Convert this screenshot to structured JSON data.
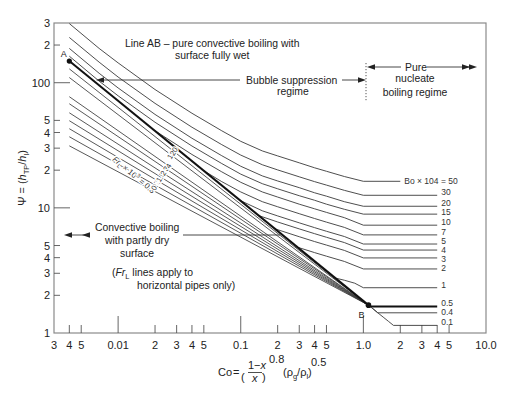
{
  "chart_data": {
    "type": "line",
    "title": "",
    "x_scale": "log",
    "y_scale": "log",
    "xlim": [
      0.003,
      10
    ],
    "ylim": [
      1,
      300
    ],
    "grid": false,
    "legend": "none",
    "xlabel": {
      "lhs": "Co",
      "eq": "=",
      "open": "(",
      "num_prefix": "1−",
      "num_var": "x",
      "den_var": "x",
      "close": ")",
      "exp1": "0.8",
      "rho_open": "(ρ",
      "rho_g_sub": "g",
      "slash_rho": "/ρ",
      "rho_l_sub": "l",
      "rho_close": ")",
      "exp2": "0.5"
    },
    "ylabel": {
      "symbol": "Ψ",
      "eq": " = (",
      "h1": "h",
      "h1_sub": "TP",
      "slash": "/",
      "h2": "h",
      "h2_sub": "l",
      "close": ")"
    },
    "x_ticks": [
      {
        "value": 0.003,
        "label": "3"
      },
      {
        "value": 0.004,
        "label": "4"
      },
      {
        "value": 0.005,
        "label": "5"
      },
      {
        "value": 0.01,
        "label": "0.01"
      },
      {
        "value": 0.02,
        "label": "2"
      },
      {
        "value": 0.03,
        "label": "3"
      },
      {
        "value": 0.04,
        "label": "4"
      },
      {
        "value": 0.05,
        "label": "5"
      },
      {
        "value": 0.1,
        "label": "0.1"
      },
      {
        "value": 0.2,
        "label": "2"
      },
      {
        "value": 0.3,
        "label": "3"
      },
      {
        "value": 0.4,
        "label": "4"
      },
      {
        "value": 0.5,
        "label": "5"
      },
      {
        "value": 1,
        "label": "1.0"
      },
      {
        "value": 2,
        "label": "2"
      },
      {
        "value": 3,
        "label": "3"
      },
      {
        "value": 4,
        "label": "4"
      },
      {
        "value": 5,
        "label": "5"
      },
      {
        "value": 10,
        "label": "10.0"
      }
    ],
    "y_ticks": [
      {
        "value": 300,
        "label": "3"
      },
      {
        "value": 200,
        "label": "2"
      },
      {
        "value": 100,
        "label": "100"
      },
      {
        "value": 50,
        "label": "5"
      },
      {
        "value": 40,
        "label": "4"
      },
      {
        "value": 30,
        "label": "3"
      },
      {
        "value": 20,
        "label": "2"
      },
      {
        "value": 10,
        "label": "10"
      },
      {
        "value": 5,
        "label": "5"
      },
      {
        "value": 4,
        "label": "4"
      },
      {
        "value": 3,
        "label": "3"
      },
      {
        "value": 2,
        "label": "2"
      },
      {
        "value": 1,
        "label": "1"
      }
    ],
    "line_AB": {
      "label": "Line AB",
      "points": [
        [
          0.004,
          149
        ],
        [
          1.1,
          1.67
        ]
      ],
      "A": {
        "label": "A",
        "co": 0.004,
        "psi": 149
      },
      "B": {
        "label": "B",
        "co": 1.1,
        "psi": 1.67
      }
    },
    "bo_series": [
      {
        "label": "Bo × 104 = 50",
        "bo_x1e4": 50,
        "points": [
          [
            0.004,
            297
          ],
          [
            0.007,
            188
          ],
          [
            0.01,
            144
          ],
          [
            0.02,
            88.2
          ],
          [
            0.04,
            57.0
          ],
          [
            0.07,
            41.3
          ],
          [
            0.1,
            34.0
          ],
          [
            0.15,
            28.5
          ],
          [
            0.2,
            26.0
          ],
          [
            0.3,
            22.9
          ],
          [
            0.4,
            20.9
          ],
          [
            0.5,
            19.6
          ],
          [
            0.7,
            17.8
          ],
          [
            1.0,
            16.3
          ],
          [
            2.0,
            16.3
          ]
        ]
      },
      {
        "label": "30",
        "bo_x1e4": 30,
        "points": [
          [
            0.004,
            230
          ],
          [
            0.007,
            146
          ],
          [
            0.01,
            111
          ],
          [
            0.02,
            68.4
          ],
          [
            0.04,
            44.1
          ],
          [
            0.07,
            32.0
          ],
          [
            0.1,
            26.4
          ],
          [
            0.15,
            22.1
          ],
          [
            0.2,
            20.1
          ],
          [
            0.3,
            17.7
          ],
          [
            0.4,
            16.2
          ],
          [
            0.5,
            15.2
          ],
          [
            0.7,
            13.8
          ],
          [
            1.0,
            12.6
          ],
          [
            4.0,
            12.6
          ]
        ]
      },
      {
        "label": "20",
        "bo_x1e4": 20,
        "points": [
          [
            0.004,
            188
          ],
          [
            0.007,
            119
          ],
          [
            0.01,
            90.8
          ],
          [
            0.02,
            55.8
          ],
          [
            0.04,
            36.0
          ],
          [
            0.07,
            26.1
          ],
          [
            0.1,
            21.5
          ],
          [
            0.15,
            18.0
          ],
          [
            0.2,
            16.4
          ],
          [
            0.3,
            14.5
          ],
          [
            0.4,
            13.2
          ],
          [
            0.5,
            12.4
          ],
          [
            0.7,
            11.2
          ],
          [
            1.0,
            10.3
          ],
          [
            4.0,
            10.3
          ]
        ]
      },
      {
        "label": "15",
        "bo_x1e4": 15,
        "points": [
          [
            0.004,
            163
          ],
          [
            0.007,
            103
          ],
          [
            0.01,
            78.6
          ],
          [
            0.02,
            48.3
          ],
          [
            0.04,
            31.2
          ],
          [
            0.07,
            22.6
          ],
          [
            0.1,
            18.6
          ],
          [
            0.15,
            15.6
          ],
          [
            0.2,
            14.2
          ],
          [
            0.3,
            12.5
          ],
          [
            0.4,
            11.5
          ],
          [
            0.5,
            10.7
          ],
          [
            0.7,
            9.74
          ],
          [
            1.0,
            8.91
          ],
          [
            4.0,
            8.91
          ]
        ]
      },
      {
        "label": "10",
        "bo_x1e4": 10,
        "points": [
          [
            0.02,
            41.3
          ],
          [
            0.04,
            26.7
          ],
          [
            0.07,
            19.4
          ],
          [
            0.1,
            16.0
          ],
          [
            0.15,
            13.4
          ],
          [
            0.2,
            12.2
          ],
          [
            0.3,
            10.7
          ],
          [
            0.4,
            9.83
          ],
          [
            0.5,
            9.2
          ],
          [
            0.7,
            8.35
          ],
          [
            1.0,
            7.27
          ],
          [
            4.0,
            7.27
          ]
        ]
      },
      {
        "label": "7",
        "bo_x1e4": 7,
        "points": [
          [
            0.05,
            19.8
          ],
          [
            0.07,
            16.2
          ],
          [
            0.1,
            13.4
          ],
          [
            0.15,
            11.2
          ],
          [
            0.2,
            10.2
          ],
          [
            0.3,
            8.98
          ],
          [
            0.4,
            8.22
          ],
          [
            0.5,
            7.69
          ],
          [
            0.7,
            6.98
          ],
          [
            1.0,
            6.08
          ],
          [
            4.0,
            6.08
          ]
        ]
      },
      {
        "label": "5",
        "bo_x1e4": 5,
        "points": [
          [
            0.1,
            11.4
          ],
          [
            0.15,
            9.47
          ],
          [
            0.2,
            8.62
          ],
          [
            0.3,
            7.59
          ],
          [
            0.4,
            6.95
          ],
          [
            0.5,
            6.5
          ],
          [
            0.7,
            5.9
          ],
          [
            1.0,
            5.14
          ],
          [
            4.0,
            5.14
          ]
        ]
      },
      {
        "label": "4",
        "bo_x1e4": 4,
        "points": [
          [
            0.14,
            8.68
          ],
          [
            0.2,
            7.71
          ],
          [
            0.3,
            6.79
          ],
          [
            0.4,
            6.22
          ],
          [
            0.5,
            5.82
          ],
          [
            0.7,
            5.28
          ],
          [
            1.0,
            4.6
          ],
          [
            4.0,
            4.6
          ]
        ]
      },
      {
        "label": "3",
        "bo_x1e4": 3,
        "points": [
          [
            0.19,
            6.8
          ],
          [
            0.3,
            5.88
          ],
          [
            0.4,
            5.38
          ],
          [
            0.5,
            5.04
          ],
          [
            0.7,
            4.57
          ],
          [
            1.0,
            3.98
          ],
          [
            4.0,
            3.98
          ]
        ]
      },
      {
        "label": "2",
        "bo_x1e4": 2,
        "points": [
          [
            0.29,
            4.85
          ],
          [
            0.4,
            4.39
          ],
          [
            0.5,
            4.11
          ],
          [
            0.7,
            3.73
          ],
          [
            1.0,
            3.25
          ],
          [
            4.0,
            3.25
          ]
        ]
      },
      {
        "label": "1",
        "bo_x1e4": 1,
        "points": [
          [
            0.6,
            2.74
          ],
          [
            0.7,
            2.64
          ],
          [
            0.85,
            2.5
          ],
          [
            1.0,
            2.3
          ],
          [
            4.0,
            2.3
          ]
        ]
      },
      {
        "label": "0.5",
        "bo_x1e4": 0.5,
        "highlight": true,
        "points": [
          [
            1.1,
            1.67
          ],
          [
            1.13,
            1.63
          ],
          [
            4.0,
            1.63
          ]
        ]
      },
      {
        "label": "0.4",
        "bo_x1e4": 0.4,
        "points": [
          [
            1.1,
            1.67
          ],
          [
            1.2,
            1.56
          ],
          [
            1.31,
            1.45
          ],
          [
            4.0,
            1.45
          ]
        ]
      },
      {
        "label": "0.1",
        "bo_x1e4": 0.1,
        "points": [
          [
            1.1,
            1.67
          ],
          [
            1.2,
            1.56
          ],
          [
            1.3,
            1.46
          ],
          [
            1.45,
            1.34
          ],
          [
            1.6,
            1.24
          ],
          [
            1.76,
            1.15
          ],
          [
            4.0,
            1.15
          ]
        ]
      }
    ],
    "fr_label": {
      "symbol": "Fr",
      "subscript": "L",
      "multiplier": " × 10",
      "exponent": "3",
      "equals": " = "
    },
    "fr_series": [
      {
        "label": "0.3",
        "fr_x1e3": 0.3,
        "points": [
          [
            0.004,
            31.3
          ],
          [
            1.1,
            1.67
          ]
        ]
      },
      {
        "label": "0.7",
        "fr_x1e3": 0.7,
        "points": [
          [
            0.004,
            37.0
          ],
          [
            1.1,
            1.67
          ]
        ]
      },
      {
        "label": "1",
        "fr_x1e3": 1,
        "points": [
          [
            0.004,
            42.9
          ],
          [
            1.1,
            1.67
          ]
        ]
      },
      {
        "label": "1.5",
        "fr_x1e3": 1.5,
        "points": [
          [
            0.004,
            49.7
          ],
          [
            1.1,
            1.67
          ]
        ]
      },
      {
        "label": "2",
        "fr_x1e3": 2,
        "points": [
          [
            0.004,
            57.5
          ],
          [
            1.1,
            1.67
          ]
        ]
      },
      {
        "label": "3",
        "fr_x1e3": 3,
        "points": [
          [
            0.004,
            67.9
          ],
          [
            1.1,
            1.67
          ]
        ]
      },
      {
        "label": "4",
        "fr_x1e3": 4,
        "points": [
          [
            0.004,
            77.3
          ],
          [
            1.1,
            1.67
          ]
        ]
      },
      {
        "label": "10",
        "fr_x1e3": 10,
        "points": [
          [
            0.004,
            110
          ],
          [
            1.1,
            1.67
          ]
        ]
      },
      {
        "label": "20",
        "fr_x1e3": 20,
        "points": [
          [
            0.004,
            129
          ],
          [
            1.1,
            1.67
          ]
        ]
      }
    ]
  },
  "annotations": {
    "line_ab": [
      "Line AB – pure convective boiling with",
      "surface fully wet"
    ],
    "bubble_suppression": [
      "Bubble suppression",
      "regime"
    ],
    "pure_nucleate": [
      "Pure",
      "nucleate",
      "boiling regime"
    ],
    "convective_dry": [
      "Convective boiling",
      "with partly dry",
      "surface"
    ],
    "fr_note": {
      "open": "(",
      "symbol": "Fr",
      "subscript": "L",
      "line1_rest": " lines apply to",
      "line2": "horizontal pipes only)"
    }
  }
}
